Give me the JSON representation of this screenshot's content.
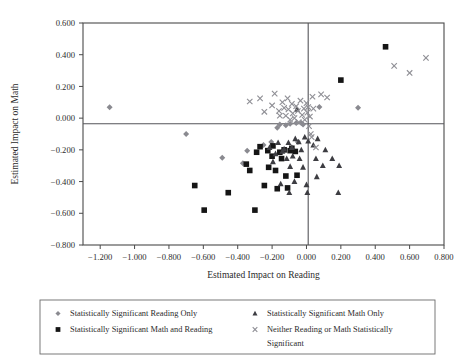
{
  "chart_data": {
    "type": "scatter",
    "title": "",
    "xlabel": "Estimated Impact on Reading",
    "ylabel": "Estimated Impact on Math",
    "xlim": [
      -1.3,
      0.8
    ],
    "ylim": [
      -0.8,
      0.6
    ],
    "xticks": [
      -1.2,
      -1.0,
      -0.8,
      -0.6,
      -0.4,
      -0.2,
      0.0,
      0.2,
      0.4,
      0.6,
      0.8
    ],
    "yticks": [
      0.6,
      0.4,
      0.2,
      0.0,
      -0.2,
      -0.4,
      -0.6,
      -0.8
    ],
    "xtick_labels": [
      "−1.200",
      "−1.000",
      "−0.800",
      "−0.600",
      "−0.400",
      "−0.200",
      "0.000",
      "0.200",
      "0.400",
      "0.600",
      "0.800"
    ],
    "ytick_labels": [
      "0.600",
      "0.400",
      "0.200",
      "0.000",
      "−0.200",
      "−0.400",
      "−0.600",
      "−0.800"
    ],
    "grid": false,
    "reference_lines": {
      "horizontal_y": -0.035,
      "vertical_x": 0.01
    },
    "legend_position": "below-plot",
    "series": [
      {
        "name": "Statistically Significant Reading Only",
        "marker": "diamond",
        "color": "#8a8a90",
        "points": [
          [
            -1.145,
            0.068
          ],
          [
            -0.7,
            -0.1
          ],
          [
            -0.49,
            -0.25
          ],
          [
            -0.37,
            -0.285
          ],
          [
            -0.345,
            -0.205
          ],
          [
            -0.25,
            -0.17
          ],
          [
            -0.205,
            -0.15
          ],
          [
            -0.17,
            -0.06
          ],
          [
            -0.155,
            -0.04
          ],
          [
            -0.12,
            -0.045
          ],
          [
            -0.095,
            -0.035
          ],
          [
            -0.06,
            -0.03
          ],
          [
            -0.05,
            -0.15
          ],
          [
            -0.03,
            -0.03
          ],
          [
            -0.02,
            -0.04
          ],
          [
            0.075,
            0.07
          ],
          [
            0.3,
            0.065
          ]
        ]
      },
      {
        "name": "Statistically Significant Math and Reading",
        "marker": "square",
        "color": "#151515",
        "points": [
          [
            -0.65,
            -0.425
          ],
          [
            -0.595,
            -0.58
          ],
          [
            -0.455,
            -0.47
          ],
          [
            -0.35,
            -0.29
          ],
          [
            -0.33,
            -0.33
          ],
          [
            -0.3,
            -0.58
          ],
          [
            -0.29,
            -0.215
          ],
          [
            -0.27,
            -0.18
          ],
          [
            -0.245,
            -0.425
          ],
          [
            -0.225,
            -0.205
          ],
          [
            -0.22,
            -0.31
          ],
          [
            -0.2,
            -0.24
          ],
          [
            -0.195,
            -0.175
          ],
          [
            -0.18,
            -0.33
          ],
          [
            -0.17,
            -0.445
          ],
          [
            -0.155,
            -0.215
          ],
          [
            -0.145,
            -0.255
          ],
          [
            -0.13,
            -0.2
          ],
          [
            -0.12,
            -0.365
          ],
          [
            -0.11,
            -0.44
          ],
          [
            -0.095,
            -0.205
          ],
          [
            -0.085,
            -0.19
          ],
          [
            -0.065,
            -0.21
          ],
          [
            -0.055,
            -0.36
          ],
          [
            0.2,
            0.24
          ],
          [
            0.46,
            0.45
          ]
        ]
      },
      {
        "name": "Statistically Significant Math Only",
        "marker": "triangle",
        "color": "#3d3d42",
        "points": [
          [
            -0.215,
            -0.185
          ],
          [
            -0.195,
            -0.275
          ],
          [
            -0.18,
            -0.225
          ],
          [
            -0.165,
            -0.155
          ],
          [
            -0.15,
            -0.415
          ],
          [
            -0.14,
            -0.21
          ],
          [
            -0.13,
            -0.195
          ],
          [
            -0.115,
            -0.255
          ],
          [
            -0.105,
            -0.155
          ],
          [
            -0.1,
            -0.47
          ],
          [
            -0.095,
            -0.305
          ],
          [
            -0.085,
            -0.185
          ],
          [
            -0.08,
            -0.24
          ],
          [
            -0.07,
            -0.4
          ],
          [
            -0.065,
            -0.13
          ],
          [
            -0.055,
            0.055
          ],
          [
            -0.045,
            -0.15
          ],
          [
            -0.04,
            -0.255
          ],
          [
            -0.03,
            -0.2
          ],
          [
            -0.02,
            -0.31
          ],
          [
            -0.01,
            -0.12
          ],
          [
            0.0,
            -0.42
          ],
          [
            0.005,
            -0.47
          ],
          [
            0.01,
            -0.145
          ],
          [
            0.04,
            -0.17
          ],
          [
            0.055,
            -0.255
          ],
          [
            0.06,
            -0.37
          ],
          [
            0.065,
            -0.13
          ],
          [
            0.095,
            -0.3
          ],
          [
            0.11,
            -0.2
          ],
          [
            0.15,
            -0.255
          ],
          [
            0.185,
            -0.47
          ],
          [
            0.19,
            -0.3
          ]
        ]
      },
      {
        "name": "Neither Reading or Math Statistically Significant",
        "marker": "cross",
        "color": "#8e8e94",
        "points": [
          [
            -0.33,
            0.105
          ],
          [
            -0.27,
            0.125
          ],
          [
            -0.245,
            0.04
          ],
          [
            -0.2,
            0.08
          ],
          [
            -0.185,
            0.155
          ],
          [
            -0.16,
            0.045
          ],
          [
            -0.155,
            0.015
          ],
          [
            -0.14,
            0.1
          ],
          [
            -0.13,
            0.065
          ],
          [
            -0.12,
            0.015
          ],
          [
            -0.11,
            0.125
          ],
          [
            -0.105,
            0.055
          ],
          [
            -0.095,
            -0.01
          ],
          [
            -0.085,
            0.09
          ],
          [
            -0.08,
            0.03
          ],
          [
            -0.07,
            0.0
          ],
          [
            -0.06,
            0.075
          ],
          [
            -0.05,
            0.045
          ],
          [
            -0.045,
            -0.025
          ],
          [
            -0.035,
            0.11
          ],
          [
            -0.025,
            0.02
          ],
          [
            -0.015,
            0.06
          ],
          [
            -0.01,
            -0.01
          ],
          [
            0.0,
            0.095
          ],
          [
            0.005,
            0.035
          ],
          [
            0.01,
            0.07
          ],
          [
            0.015,
            -0.05
          ],
          [
            0.02,
            0.01
          ],
          [
            0.025,
            -0.1
          ],
          [
            0.03,
            -0.12
          ],
          [
            0.035,
            0.135
          ],
          [
            0.04,
            0.06
          ],
          [
            0.055,
            -0.185
          ],
          [
            0.085,
            0.15
          ],
          [
            0.12,
            0.13
          ],
          [
            0.51,
            0.33
          ],
          [
            0.6,
            0.285
          ],
          [
            0.695,
            0.38
          ]
        ]
      }
    ]
  },
  "legend": {
    "entries": [
      {
        "label": "Statistically Significant Reading Only",
        "marker": "diamond"
      },
      {
        "label": "Statistically Significant Math Only",
        "marker": "triangle"
      },
      {
        "label": "Statistically Significant Math and Reading",
        "marker": "square"
      },
      {
        "label": "Neither Reading or Math Statistically",
        "marker": "cross"
      },
      {
        "label": "Significant",
        "marker": "none"
      }
    ]
  }
}
